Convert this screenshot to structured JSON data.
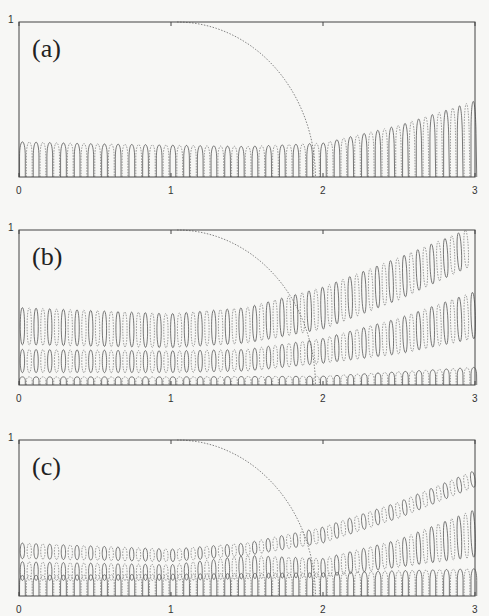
{
  "figure": {
    "width": 489,
    "height": 616,
    "ink_color": "#444444",
    "background": "#f7f7f5"
  },
  "chart_data": [
    {
      "type": "line",
      "panel_label": "(a)",
      "title": "",
      "xlabel": "",
      "ylabel": "",
      "x_ticks": [
        "0",
        "1",
        "2",
        "3"
      ],
      "y_tick_labels": [
        "1"
      ],
      "xlim": [
        0,
        3
      ],
      "ylim": [
        0,
        1
      ],
      "frame_px": {
        "left": 19,
        "top": 22,
        "right": 475,
        "bottom": 177
      },
      "grid": false,
      "dashed_arc": {
        "x_start": 1.04,
        "y_start": 1.0,
        "x_end": 1.95,
        "y_end": 0.0
      },
      "lobe_spacing": 0.045,
      "bands": [
        {
          "name": "mode-1",
          "lower": [
            [
              0,
              0
            ],
            [
              3,
              0
            ]
          ],
          "upper": [
            [
              0,
              0.26
            ],
            [
              0.5,
              0.245
            ],
            [
              1.0,
              0.235
            ],
            [
              1.5,
              0.225
            ],
            [
              2.0,
              0.25
            ],
            [
              2.5,
              0.38
            ],
            [
              3.0,
              0.56
            ]
          ],
          "lean": [
            [
              0,
              0
            ],
            [
              2,
              0.1
            ],
            [
              3,
              0.5
            ]
          ]
        }
      ]
    },
    {
      "type": "line",
      "panel_label": "(b)",
      "title": "",
      "xlabel": "",
      "ylabel": "",
      "x_ticks": [
        "0",
        "1",
        "2",
        "3"
      ],
      "y_tick_labels": [
        "1"
      ],
      "xlim": [
        0,
        3
      ],
      "ylim": [
        0,
        1
      ],
      "frame_px": {
        "left": 19,
        "top": 230,
        "right": 475,
        "bottom": 385
      },
      "grid": false,
      "dashed_arc": {
        "x_start": 1.04,
        "y_start": 1.0,
        "x_end": 1.95,
        "y_end": 0.0
      },
      "lobe_spacing": 0.045,
      "bands": [
        {
          "name": "mode-3",
          "lower": [
            [
              0,
              0.26
            ],
            [
              1.0,
              0.24
            ],
            [
              1.5,
              0.27
            ],
            [
              2.0,
              0.36
            ],
            [
              2.5,
              0.55
            ],
            [
              3.0,
              0.78
            ]
          ],
          "upper": [
            [
              0,
              0.5
            ],
            [
              1.0,
              0.46
            ],
            [
              1.5,
              0.5
            ],
            [
              2.0,
              0.63
            ],
            [
              2.5,
              0.82
            ],
            [
              3.0,
              1.02
            ]
          ],
          "lean": [
            [
              0,
              0
            ],
            [
              1.5,
              0.15
            ],
            [
              3,
              0.6
            ]
          ]
        },
        {
          "name": "mode-2",
          "lower": [
            [
              0,
              0.08
            ],
            [
              1.0,
              0.08
            ],
            [
              1.5,
              0.09
            ],
            [
              2.0,
              0.14
            ],
            [
              2.5,
              0.2
            ],
            [
              3.0,
              0.3
            ]
          ],
          "upper": [
            [
              0,
              0.23
            ],
            [
              1.0,
              0.22
            ],
            [
              1.5,
              0.23
            ],
            [
              2.0,
              0.3
            ],
            [
              2.5,
              0.43
            ],
            [
              3.0,
              0.6
            ]
          ],
          "lean": [
            [
              0,
              0
            ],
            [
              1.8,
              0.1
            ],
            [
              3,
              0.5
            ]
          ]
        },
        {
          "name": "mode-1",
          "lower": [
            [
              0,
              0
            ],
            [
              3,
              0
            ]
          ],
          "upper": [
            [
              0,
              0.06
            ],
            [
              1.0,
              0.06
            ],
            [
              2.0,
              0.065
            ],
            [
              3.0,
              0.13
            ]
          ],
          "lean": [
            [
              0,
              0
            ],
            [
              3,
              0.1
            ]
          ]
        }
      ]
    },
    {
      "type": "line",
      "panel_label": "(c)",
      "title": "",
      "xlabel": "",
      "ylabel": "",
      "x_ticks": [
        "0",
        "1",
        "2",
        "3"
      ],
      "y_tick_labels": [
        "1"
      ],
      "xlim": [
        0,
        3
      ],
      "ylim": [
        0,
        1
      ],
      "frame_px": {
        "left": 19,
        "top": 440,
        "right": 475,
        "bottom": 596
      },
      "grid": false,
      "dashed_arc": {
        "x_start": 1.04,
        "y_start": 1.0,
        "x_end": 1.95,
        "y_end": 0.0
      },
      "lobe_spacing": 0.045,
      "bands": [
        {
          "name": "mode-3",
          "lower": [
            [
              0,
              0.24
            ],
            [
              1.0,
              0.22
            ],
            [
              1.5,
              0.26
            ],
            [
              2.0,
              0.34
            ],
            [
              2.5,
              0.5
            ],
            [
              3.0,
              0.7
            ]
          ],
          "upper": [
            [
              0,
              0.34
            ],
            [
              1.0,
              0.3
            ],
            [
              1.5,
              0.34
            ],
            [
              2.0,
              0.44
            ],
            [
              2.5,
              0.6
            ],
            [
              3.0,
              0.8
            ]
          ],
          "lean": [
            [
              0,
              0
            ],
            [
              1.5,
              0.2
            ],
            [
              3,
              0.7
            ]
          ]
        },
        {
          "name": "mode-2",
          "lower": [
            [
              0,
              0.1
            ],
            [
              1.0,
              0.1
            ],
            [
              2.0,
              0.12
            ],
            [
              3.0,
              0.25
            ]
          ],
          "upper": [
            [
              0,
              0.22
            ],
            [
              1.0,
              0.2
            ],
            [
              1.5,
              0.26
            ],
            [
              2.0,
              0.24
            ],
            [
              2.5,
              0.36
            ],
            [
              3.0,
              0.55
            ]
          ],
          "lean": [
            [
              0,
              0
            ],
            [
              2,
              0.2
            ],
            [
              3,
              0.6
            ]
          ]
        },
        {
          "name": "mode-1",
          "lower": [
            [
              0,
              0
            ],
            [
              3,
              0
            ]
          ],
          "upper": [
            [
              0,
              0.15
            ],
            [
              1.0,
              0.16
            ],
            [
              2.0,
              0.17
            ],
            [
              3.0,
              0.2
            ]
          ],
          "lean": [
            [
              0,
              0
            ],
            [
              3,
              0
            ]
          ]
        }
      ]
    }
  ]
}
